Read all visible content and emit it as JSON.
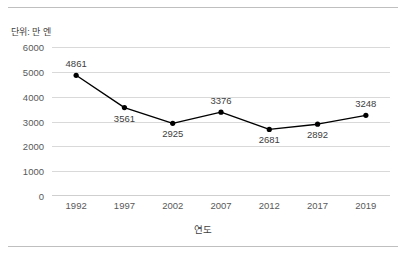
{
  "unit_label": "단위: 만 엔",
  "chart_data": {
    "type": "line",
    "title": "",
    "subtitle": "",
    "xlabel": "연도",
    "ylabel": "",
    "unit_note": "단위: 만 엔",
    "categories": [
      "1992",
      "1997",
      "2002",
      "2007",
      "2012",
      "2017",
      "2019"
    ],
    "values": [
      4861,
      3561,
      2925,
      3376,
      2681,
      2892,
      3248
    ],
    "data_labels": [
      "4861",
      "3561",
      "2925",
      "3376",
      "2681",
      "2892",
      "3248"
    ],
    "label_positions": [
      "above",
      "below",
      "below",
      "above",
      "below",
      "below",
      "above"
    ],
    "yticks": [
      "6000",
      "5000",
      "4000",
      "3000",
      "2000",
      "1000",
      "0"
    ],
    "ytick_values": [
      6000,
      5000,
      4000,
      3000,
      2000,
      1000,
      0
    ],
    "ylim": [
      0,
      6000
    ],
    "ystep": 1000,
    "grid": true,
    "legend": "none",
    "series": [
      {
        "name": "",
        "values": [
          4861,
          3561,
          2925,
          3376,
          2681,
          2892,
          3248
        ],
        "line_color": "#000000",
        "marker": "circle",
        "marker_color": "#000000"
      }
    ],
    "colors": {
      "line": "#000000",
      "marker": "#000000",
      "gridline": "#d9d9d9",
      "axis": "#cfcfcf",
      "text": "#404040",
      "tick_text": "#595959",
      "frame_rule": "#bfbfbf",
      "background": "#ffffff"
    }
  }
}
